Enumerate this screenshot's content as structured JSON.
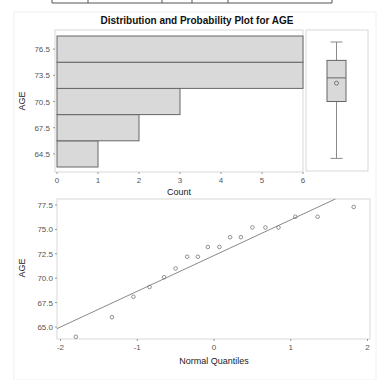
{
  "title": "Distribution and Probability Plot for AGE",
  "colors": {
    "bar_fill": "#d9d9d9",
    "bar_stroke": "#666666",
    "box_fill": "#d9d9d9",
    "line": "#8a8a8a",
    "marker": "#777777",
    "frame": "#d0d0d0"
  },
  "chart_data": [
    {
      "type": "bar",
      "orientation": "horizontal",
      "title": "Distribution and Probability Plot for AGE",
      "xlabel": "Count",
      "ylabel": "AGE",
      "categories": [
        "64.5",
        "67.5",
        "70.5",
        "73.5",
        "76.5"
      ],
      "values": [
        1,
        2,
        3,
        6,
        6
      ],
      "xlim": [
        0,
        6
      ],
      "xticks": [
        "0",
        "1",
        "2",
        "3",
        "4",
        "5",
        "6"
      ],
      "grid": false
    },
    {
      "type": "box",
      "orientation": "vertical",
      "ylabel": "AGE",
      "whisker_low": 64.0,
      "q1": 70.5,
      "median": 73.2,
      "mean": 72.6,
      "q3": 75.2,
      "whisker_high": 77.3
    },
    {
      "type": "scatter",
      "xlabel": "Normal Quantiles",
      "ylabel": "AGE",
      "xlim": [
        -2,
        2
      ],
      "ylim": [
        64,
        77.5
      ],
      "xticks": [
        "-2",
        "-1",
        "0",
        "1",
        "2"
      ],
      "yticks": [
        "65.0",
        "67.5",
        "70.0",
        "72.5",
        "75.0",
        "77.5"
      ],
      "x": [
        -1.8,
        -1.33,
        -1.05,
        -0.84,
        -0.65,
        -0.5,
        -0.35,
        -0.21,
        -0.08,
        0.07,
        0.21,
        0.35,
        0.5,
        0.67,
        0.84,
        1.06,
        1.35,
        1.82
      ],
      "y": [
        64.0,
        66.0,
        68.1,
        69.1,
        70.1,
        71.0,
        72.2,
        72.2,
        73.2,
        73.2,
        74.2,
        74.2,
        75.2,
        75.2,
        75.2,
        76.3,
        76.3,
        77.3
      ],
      "reference_line": {
        "x0": -2.0,
        "y0": 65.0,
        "x1": 1.55,
        "y1": 78.0
      },
      "grid": false
    }
  ]
}
